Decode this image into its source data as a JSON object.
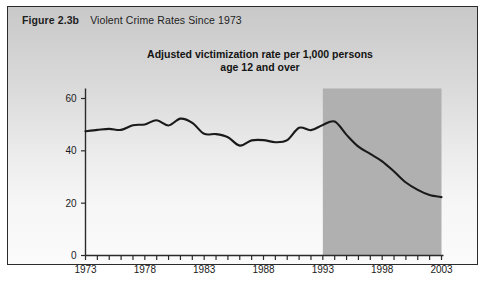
{
  "figure": {
    "label": "Figure 2.3b",
    "title": "Violent Crime Rates Since 1973"
  },
  "chart_title_line1": "Adjusted victimization rate per 1,000 persons",
  "chart_title_line2": "age 12 and over",
  "colors": {
    "line": "#1a1a1a",
    "axis": "#2b2b2b",
    "shaded_region": "#b0b0b0",
    "panel_border": "#2b2b2b",
    "text": "#1a1a1a"
  },
  "chart_data": {
    "type": "line",
    "title": "Adjusted victimization rate per 1,000 persons age 12 and over",
    "xlabel": "",
    "ylabel": "",
    "xlim": [
      1973,
      2003
    ],
    "ylim": [
      0,
      65
    ],
    "yticks": [
      0,
      20,
      40,
      60
    ],
    "ytick_labels": [
      "0",
      "20",
      "40",
      "60"
    ],
    "xticks": [
      1973,
      1974,
      1975,
      1976,
      1977,
      1978,
      1979,
      1980,
      1981,
      1982,
      1983,
      1984,
      1985,
      1986,
      1987,
      1988,
      1989,
      1990,
      1991,
      1992,
      1993,
      1994,
      1995,
      1996,
      1997,
      1998,
      1999,
      2000,
      2001,
      2002,
      2003
    ],
    "xtick_labels_shown": [
      "1973",
      "1978",
      "1983",
      "1988",
      "1993",
      "1998",
      "2003"
    ],
    "xtick_labels_shown_years": [
      1973,
      1978,
      1983,
      1988,
      1993,
      1998,
      2003
    ],
    "grid": false,
    "legend": null,
    "annotations": [
      {
        "type": "shaded-region",
        "name": "redesign-period-shading",
        "x_start": 1993,
        "x_end": 2003,
        "color": "#b0b0b0"
      }
    ],
    "series": [
      {
        "name": "Adjusted victimization rate per 1,000 persons age 12 and over",
        "x": [
          1973,
          1974,
          1975,
          1976,
          1977,
          1978,
          1979,
          1980,
          1981,
          1982,
          1983,
          1984,
          1985,
          1986,
          1987,
          1988,
          1989,
          1990,
          1991,
          1992,
          1993,
          1994,
          1995,
          1996,
          1997,
          1998,
          1999,
          2000,
          2001,
          2002,
          2003
        ],
        "values": [
          47.5,
          48.0,
          48.4,
          48.0,
          49.8,
          50.1,
          51.7,
          49.7,
          52.3,
          50.7,
          46.5,
          46.4,
          45.2,
          42.0,
          44.0,
          44.1,
          43.3,
          44.1,
          48.8,
          47.9,
          49.9,
          51.2,
          46.1,
          41.6,
          38.8,
          36.0,
          32.1,
          27.9,
          25.1,
          23.1,
          22.3
        ]
      }
    ]
  }
}
